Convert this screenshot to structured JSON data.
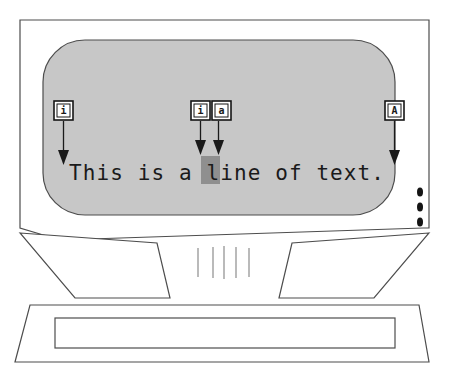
{
  "figure": {
    "type": "diagram",
    "device": "desktop computer monitor"
  },
  "screen": {
    "text_line": "This is a line of text.",
    "highlighted_character": "l",
    "highlight_color": "#8f8f8f",
    "background_color": "#c7c7c7",
    "text_color": "#1a1a1a"
  },
  "key_labels": [
    {
      "id": "left-key",
      "letter": "i",
      "points_to": "start-of-line"
    },
    {
      "id": "middle-key-1",
      "letter": "i",
      "points_to": "highlighted-character"
    },
    {
      "id": "middle-key-2",
      "letter": "a",
      "points_to": "after-highlighted-character"
    },
    {
      "id": "right-key",
      "letter": "A",
      "points_to": "end-of-line"
    }
  ],
  "monitor": {
    "bezel_color": "#ffffff",
    "outline_color": "#4d4d4d",
    "led_count": 3,
    "led_color": "#141414",
    "vent_line_count": 5,
    "base_inner_color": "#e0e0e0"
  }
}
